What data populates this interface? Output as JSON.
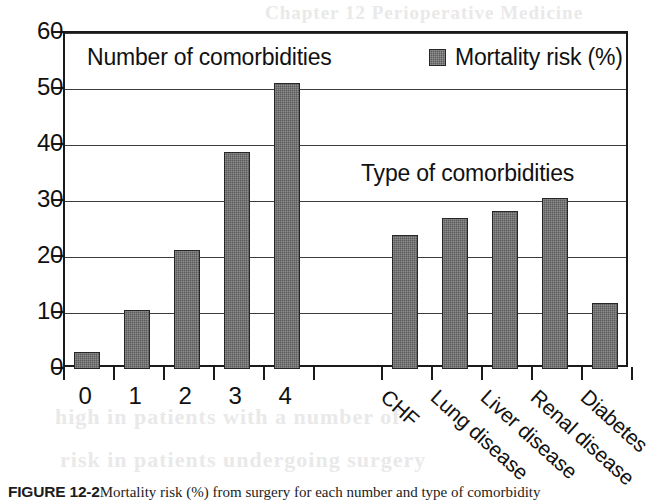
{
  "figure": {
    "caption_label": "FIGURE 12-2",
    "caption_text": "Mortality risk (%) from surgery for each number and type of comorbidity"
  },
  "legend": {
    "label": "Mortality risk (%)",
    "swatch_name": "bar-series-swatch",
    "swatch_color": "#5b5b5b"
  },
  "annotations": {
    "left_group": "Number of comorbidities",
    "right_group": "Type of comorbidities"
  },
  "bleed_text": {
    "line1": "Chapter 12 Perioperative Medicine",
    "line2": "mortality risk of patients undergoing",
    "line3": "in the presence of a number of",
    "line4": "the probability of perioperative",
    "line5": "high in patients with a number of",
    "line6": "risk in patients undergoing surgery"
  },
  "chart_data": {
    "type": "bar",
    "title": "",
    "xlabel": "",
    "ylabel": "",
    "ylim": [
      0,
      60
    ],
    "yticks": [
      0,
      10,
      20,
      30,
      40,
      50,
      60
    ],
    "grid": true,
    "legend_position": "top-right",
    "groups": [
      {
        "name": "Number of comorbidities",
        "categories": [
          "0",
          "1",
          "2",
          "3",
          "4"
        ],
        "values": [
          3.0,
          10.5,
          21.3,
          38.7,
          51.0
        ]
      },
      {
        "name": "Type of comorbidities",
        "categories": [
          "CHF",
          "Lung disease",
          "Liver disease",
          "Renal disease",
          "Diabetes"
        ],
        "values": [
          24.0,
          27.0,
          28.3,
          30.5,
          11.8
        ]
      }
    ],
    "series": [
      {
        "name": "Mortality risk (%)",
        "categories": [
          "0",
          "1",
          "2",
          "3",
          "4",
          "CHF",
          "Lung disease",
          "Liver disease",
          "Renal disease",
          "Diabetes"
        ],
        "values": [
          3.0,
          10.5,
          21.3,
          38.7,
          51.0,
          24.0,
          27.0,
          28.3,
          30.5,
          11.8
        ]
      }
    ]
  }
}
